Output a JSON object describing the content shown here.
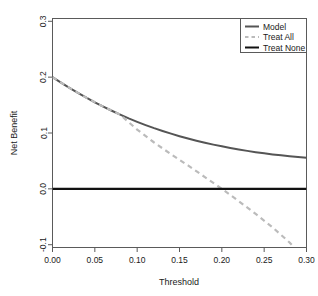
{
  "chart_data": {
    "type": "line",
    "title": "",
    "xlabel": "Threshold",
    "ylabel": "Net Benefit",
    "xlim": [
      0.0,
      0.3
    ],
    "ylim": [
      -0.105,
      0.305
    ],
    "grid": false,
    "legend_position": "top-right",
    "x_ticks": [
      0.0,
      0.05,
      0.1,
      0.15,
      0.2,
      0.25,
      0.3
    ],
    "x_tick_labels": [
      "0.00",
      "0.05",
      "0.10",
      "0.15",
      "0.20",
      "0.25",
      "0.30"
    ],
    "y_ticks": [
      -0.1,
      0.0,
      0.1,
      0.2,
      0.3
    ],
    "y_tick_labels": [
      "-0.1",
      "0.0",
      "0.1",
      "0.2",
      "0.3"
    ],
    "series": [
      {
        "name": "Model",
        "style": "solid",
        "color": "#555555",
        "width": 2.0,
        "x": [
          0.0,
          0.01,
          0.02,
          0.03,
          0.04,
          0.05,
          0.06,
          0.07,
          0.08,
          0.09,
          0.1,
          0.11,
          0.12,
          0.13,
          0.14,
          0.15,
          0.16,
          0.17,
          0.18,
          0.19,
          0.2,
          0.21,
          0.22,
          0.23,
          0.24,
          0.25,
          0.26,
          0.27,
          0.28,
          0.29,
          0.3
        ],
        "y": [
          0.2,
          0.1902,
          0.1808,
          0.1718,
          0.1632,
          0.155,
          0.1472,
          0.1398,
          0.1328,
          0.1262,
          0.12,
          0.1142,
          0.1087,
          0.1036,
          0.0988,
          0.0943,
          0.0901,
          0.0862,
          0.0826,
          0.0792,
          0.0761,
          0.0732,
          0.0705,
          0.068,
          0.0657,
          0.0636,
          0.0617,
          0.06,
          0.0584,
          0.057,
          0.0555
        ]
      },
      {
        "name": "Treat All",
        "style": "dashed",
        "color": "#bbbbbb",
        "width": 2.2,
        "x": [
          0.0,
          0.02,
          0.04,
          0.06,
          0.08,
          0.1,
          0.12,
          0.14,
          0.16,
          0.18,
          0.2,
          0.22,
          0.24,
          0.26,
          0.28,
          0.2855
        ],
        "y": [
          0.2,
          0.1808,
          0.1632,
          0.1472,
          0.1328,
          0.106,
          0.083,
          0.062,
          0.042,
          0.021,
          0.0,
          -0.022,
          -0.045,
          -0.069,
          -0.096,
          -0.105
        ]
      },
      {
        "name": "Treat None",
        "style": "solid",
        "color": "#111111",
        "width": 2.2,
        "x": [
          0.0,
          0.3
        ],
        "y": [
          0.0,
          0.0
        ]
      }
    ]
  },
  "legend": {
    "items": [
      {
        "label": "Model",
        "style": "solid",
        "color": "#555555"
      },
      {
        "label": "Treat All",
        "style": "dashed",
        "color": "#bbbbbb"
      },
      {
        "label": "Treat None",
        "style": "solid",
        "color": "#111111"
      }
    ]
  },
  "axes": {
    "x_title": "Threshold",
    "y_title": "Net Benefit"
  },
  "colors": {
    "model": "#555555",
    "treat_all": "#bbbbbb",
    "treat_none": "#111111",
    "frame": "#5a5a5a",
    "text": "#1a1a1a",
    "background": "#ffffff"
  }
}
